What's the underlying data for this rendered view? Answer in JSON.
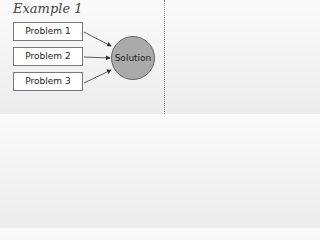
{
  "diagram": {
    "title": "Example 1",
    "problems": [
      {
        "label": "Problem 1"
      },
      {
        "label": "Problem 2"
      },
      {
        "label": "Problem 3"
      }
    ],
    "solution": {
      "label": "Solution",
      "fill": "#aaaaaa"
    },
    "edges": [
      {
        "from": "Problem 1",
        "to": "Solution"
      },
      {
        "from": "Problem 2",
        "to": "Solution"
      },
      {
        "from": "Problem 3",
        "to": "Solution"
      }
    ]
  }
}
